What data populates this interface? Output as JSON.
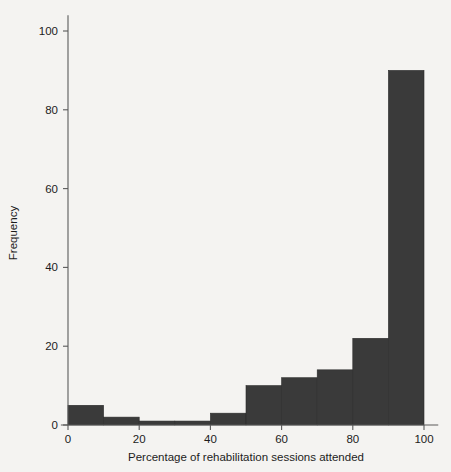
{
  "chart_data": {
    "type": "bar",
    "title": "",
    "subtitle": "",
    "xlabel": "Percentage of rehabilitation sessions attended",
    "ylabel": "Frequency",
    "categories": [
      "0-10",
      "10-20",
      "20-30",
      "30-40",
      "40-50",
      "50-60",
      "60-70",
      "70-80",
      "80-90",
      "90-100"
    ],
    "bin_edges": [
      0,
      10,
      20,
      30,
      40,
      50,
      60,
      70,
      80,
      90,
      100
    ],
    "values": [
      5,
      2,
      1,
      1,
      3,
      10,
      12,
      14,
      22,
      90
    ],
    "xlim": [
      -2,
      104
    ],
    "ylim": [
      0,
      104
    ],
    "xticks": [
      0,
      20,
      40,
      60,
      80,
      100
    ],
    "yticks": [
      0,
      20,
      40,
      60,
      80,
      100
    ],
    "xtick_labels": [
      "0",
      "20",
      "40",
      "60",
      "80",
      "100"
    ],
    "ytick_labels": [
      "0",
      "20",
      "40",
      "60",
      "80",
      "100"
    ],
    "grid": false,
    "legend": null,
    "bar_color": "#3a3a3a",
    "axis_color": "#5a5a5a",
    "background_color": "#f4f3f1"
  },
  "axes": {
    "x_title": "Percentage of rehabilitation sessions attended",
    "y_title": "Frequency"
  }
}
